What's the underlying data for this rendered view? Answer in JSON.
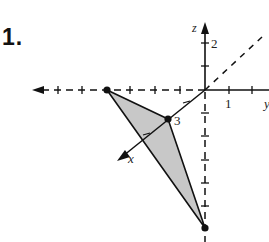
{
  "problem": {
    "number_label": "1."
  },
  "axes": {
    "z_label": "z",
    "x_label": "x",
    "y_label": "y",
    "tick_labels": {
      "z_2": "2",
      "y_1": "1",
      "x_3": "3"
    }
  },
  "figure": {
    "type": "3d-coordinate-triangle",
    "fill_color": "#c8c8c8",
    "stroke_color": "#111111",
    "vertices": [
      {
        "name": "vertex-negative-y",
        "position": "on negative y-axis"
      },
      {
        "name": "vertex-x3",
        "position": "on x-axis at 3",
        "label": "3"
      },
      {
        "name": "vertex-negative-z",
        "position": "on negative z-axis"
      }
    ]
  }
}
